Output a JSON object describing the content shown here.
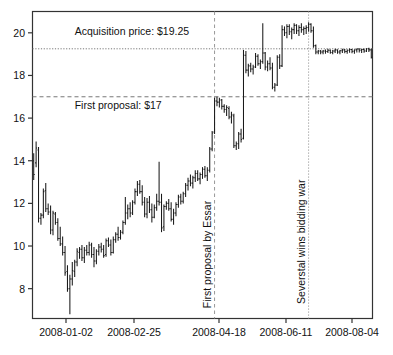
{
  "chart_data": {
    "type": "ohlc",
    "title": "",
    "xlabel": "",
    "ylabel": "",
    "ylim": [
      6.6,
      21.0
    ],
    "yticks": [
      8,
      10,
      12,
      14,
      16,
      18,
      20
    ],
    "ytick_labels": [
      "8",
      "10",
      "12",
      "14",
      "16",
      "18",
      "20"
    ],
    "xlim": [
      "2008-01-02",
      "2008-08-08"
    ],
    "xticks": [
      "2008-01-02",
      "2008-02-25",
      "2008-04-18",
      "2008-06-11",
      "2008-08-04"
    ],
    "xtick_labels": [
      "2008-01-02",
      "2008-02-25",
      "2008-04-18",
      "2008-06-11",
      "2008-08-04"
    ],
    "grid": false,
    "legend": "none",
    "series_name": "Esmark share price (USD)",
    "hlines": [
      {
        "name": "acquisition-price-line",
        "value": 19.25,
        "style": "dotted",
        "label": "Acquisition price: $19.25"
      },
      {
        "name": "first-proposal-line",
        "value": 17.0,
        "style": "dashed",
        "label": "First proposal: $17"
      }
    ],
    "vlines": [
      {
        "name": "first-proposal-event",
        "x_index": 75,
        "style": "dashed",
        "label": "First proposal by Essar"
      },
      {
        "name": "severstal-event",
        "x_index": 114,
        "style": "dotted",
        "label": "Severstal wins bidding war"
      }
    ],
    "annotations": [
      {
        "text": "Acquisition price: $19.25",
        "x_index": 17,
        "y": 19.9,
        "rotation": 0
      },
      {
        "text": "First proposal: $17",
        "x_index": 17,
        "y": 16.45,
        "rotation": 0
      },
      {
        "text": "First proposal by Essar",
        "x_index": 75,
        "y": 9.6,
        "rotation": 90
      },
      {
        "text": "Severstal wins bidding war",
        "x_index": 114,
        "y": 10.2,
        "rotation": 90
      }
    ],
    "bars": [
      {
        "h": 14.35,
        "l": 13.1,
        "o": 14.0,
        "c": 13.35
      },
      {
        "h": 14.9,
        "l": 13.7,
        "o": 13.9,
        "c": 14.6
      },
      {
        "h": 14.65,
        "l": 11.1,
        "o": 14.5,
        "c": 11.3
      },
      {
        "h": 11.55,
        "l": 11.0,
        "o": 11.3,
        "c": 11.45
      },
      {
        "h": 12.7,
        "l": 11.3,
        "o": 11.45,
        "c": 12.55
      },
      {
        "h": 12.95,
        "l": 11.6,
        "o": 12.6,
        "c": 11.75
      },
      {
        "h": 12.0,
        "l": 11.45,
        "o": 11.75,
        "c": 11.6
      },
      {
        "h": 11.9,
        "l": 10.55,
        "o": 11.6,
        "c": 10.75
      },
      {
        "h": 11.65,
        "l": 10.5,
        "o": 10.75,
        "c": 11.55
      },
      {
        "h": 11.6,
        "l": 11.0,
        "o": 11.5,
        "c": 11.1
      },
      {
        "h": 11.3,
        "l": 10.25,
        "o": 11.1,
        "c": 10.35
      },
      {
        "h": 10.9,
        "l": 10.0,
        "o": 10.35,
        "c": 10.1
      },
      {
        "h": 10.45,
        "l": 9.55,
        "o": 10.1,
        "c": 9.7
      },
      {
        "h": 10.0,
        "l": 8.6,
        "o": 9.7,
        "c": 8.75
      },
      {
        "h": 9.1,
        "l": 7.85,
        "o": 8.8,
        "c": 8.0
      },
      {
        "h": 8.65,
        "l": 6.8,
        "o": 8.0,
        "c": 8.45
      },
      {
        "h": 9.25,
        "l": 8.15,
        "o": 8.45,
        "c": 8.85
      },
      {
        "h": 9.35,
        "l": 8.55,
        "o": 8.8,
        "c": 9.25
      },
      {
        "h": 9.9,
        "l": 9.05,
        "o": 9.25,
        "c": 9.75
      },
      {
        "h": 9.95,
        "l": 9.4,
        "o": 9.7,
        "c": 9.85
      },
      {
        "h": 10.05,
        "l": 9.3,
        "o": 9.85,
        "c": 9.45
      },
      {
        "h": 9.95,
        "l": 9.2,
        "o": 9.45,
        "c": 9.8
      },
      {
        "h": 10.05,
        "l": 9.55,
        "o": 9.8,
        "c": 9.7
      },
      {
        "h": 10.2,
        "l": 9.55,
        "o": 9.7,
        "c": 10.05
      },
      {
        "h": 10.15,
        "l": 9.45,
        "o": 10.05,
        "c": 9.6
      },
      {
        "h": 9.95,
        "l": 9.0,
        "o": 9.6,
        "c": 9.3
      },
      {
        "h": 9.85,
        "l": 9.15,
        "o": 9.3,
        "c": 9.75
      },
      {
        "h": 10.1,
        "l": 9.55,
        "o": 9.75,
        "c": 9.95
      },
      {
        "h": 10.15,
        "l": 9.7,
        "o": 9.95,
        "c": 9.85
      },
      {
        "h": 10.05,
        "l": 9.45,
        "o": 9.85,
        "c": 9.55
      },
      {
        "h": 10.35,
        "l": 9.5,
        "o": 9.6,
        "c": 10.25
      },
      {
        "h": 10.4,
        "l": 9.95,
        "o": 10.25,
        "c": 10.05
      },
      {
        "h": 10.3,
        "l": 9.55,
        "o": 10.05,
        "c": 9.7
      },
      {
        "h": 10.45,
        "l": 9.65,
        "o": 9.7,
        "c": 10.3
      },
      {
        "h": 10.65,
        "l": 10.15,
        "o": 10.3,
        "c": 10.55
      },
      {
        "h": 10.9,
        "l": 10.25,
        "o": 10.55,
        "c": 10.4
      },
      {
        "h": 10.75,
        "l": 10.3,
        "o": 10.4,
        "c": 10.65
      },
      {
        "h": 11.2,
        "l": 10.55,
        "o": 10.65,
        "c": 11.1
      },
      {
        "h": 12.3,
        "l": 11.0,
        "o": 11.1,
        "c": 11.55
      },
      {
        "h": 11.95,
        "l": 11.25,
        "o": 11.55,
        "c": 11.75
      },
      {
        "h": 12.05,
        "l": 11.35,
        "o": 11.75,
        "c": 11.55
      },
      {
        "h": 12.15,
        "l": 11.45,
        "o": 11.55,
        "c": 12.05
      },
      {
        "h": 12.7,
        "l": 11.95,
        "o": 12.05,
        "c": 12.55
      },
      {
        "h": 13.05,
        "l": 12.35,
        "o": 12.55,
        "c": 12.9
      },
      {
        "h": 13.1,
        "l": 12.45,
        "o": 12.9,
        "c": 12.55
      },
      {
        "h": 12.85,
        "l": 11.9,
        "o": 12.55,
        "c": 12.05
      },
      {
        "h": 12.3,
        "l": 11.35,
        "o": 12.05,
        "c": 11.5
      },
      {
        "h": 12.25,
        "l": 11.3,
        "o": 11.5,
        "c": 12.05
      },
      {
        "h": 12.35,
        "l": 11.55,
        "o": 12.05,
        "c": 11.7
      },
      {
        "h": 12.0,
        "l": 11.1,
        "o": 11.7,
        "c": 11.35
      },
      {
        "h": 11.95,
        "l": 11.3,
        "o": 11.35,
        "c": 11.8
      },
      {
        "h": 12.45,
        "l": 11.65,
        "o": 11.8,
        "c": 12.1
      },
      {
        "h": 13.95,
        "l": 11.9,
        "o": 12.1,
        "c": 12.05
      },
      {
        "h": 12.45,
        "l": 10.65,
        "o": 12.05,
        "c": 10.85
      },
      {
        "h": 11.95,
        "l": 10.7,
        "o": 10.9,
        "c": 11.85
      },
      {
        "h": 12.1,
        "l": 11.7,
        "o": 11.85,
        "c": 12.0
      },
      {
        "h": 12.2,
        "l": 11.65,
        "o": 12.0,
        "c": 11.75
      },
      {
        "h": 12.05,
        "l": 11.15,
        "o": 11.75,
        "c": 11.25
      },
      {
        "h": 11.75,
        "l": 11.0,
        "o": 11.25,
        "c": 11.55
      },
      {
        "h": 12.05,
        "l": 11.4,
        "o": 11.55,
        "c": 11.95
      },
      {
        "h": 12.4,
        "l": 11.8,
        "o": 11.95,
        "c": 12.3
      },
      {
        "h": 12.45,
        "l": 11.95,
        "o": 12.3,
        "c": 12.1
      },
      {
        "h": 12.55,
        "l": 12.0,
        "o": 12.1,
        "c": 12.45
      },
      {
        "h": 12.95,
        "l": 12.3,
        "o": 12.45,
        "c": 12.85
      },
      {
        "h": 13.2,
        "l": 12.6,
        "o": 12.85,
        "c": 13.05
      },
      {
        "h": 13.35,
        "l": 12.8,
        "o": 13.05,
        "c": 12.95
      },
      {
        "h": 13.3,
        "l": 12.7,
        "o": 12.95,
        "c": 13.2
      },
      {
        "h": 13.55,
        "l": 13.0,
        "o": 13.2,
        "c": 13.4
      },
      {
        "h": 13.55,
        "l": 13.05,
        "o": 13.4,
        "c": 13.15
      },
      {
        "h": 13.45,
        "l": 12.9,
        "o": 13.15,
        "c": 13.35
      },
      {
        "h": 13.7,
        "l": 13.15,
        "o": 13.35,
        "c": 13.6
      },
      {
        "h": 13.75,
        "l": 13.2,
        "o": 13.6,
        "c": 13.3
      },
      {
        "h": 13.7,
        "l": 13.05,
        "o": 13.3,
        "c": 13.55
      },
      {
        "h": 14.65,
        "l": 13.45,
        "o": 13.55,
        "c": 14.55
      },
      {
        "h": 15.4,
        "l": 14.45,
        "o": 14.55,
        "c": 15.3
      },
      {
        "h": 16.95,
        "l": 15.25,
        "o": 15.35,
        "c": 16.8
      },
      {
        "h": 17.0,
        "l": 16.55,
        "o": 16.8,
        "c": 16.75
      },
      {
        "h": 16.95,
        "l": 16.5,
        "o": 16.75,
        "c": 16.85
      },
      {
        "h": 16.9,
        "l": 16.4,
        "o": 16.85,
        "c": 16.55
      },
      {
        "h": 16.65,
        "l": 16.25,
        "o": 16.55,
        "c": 16.4
      },
      {
        "h": 16.6,
        "l": 16.1,
        "o": 16.4,
        "c": 16.5
      },
      {
        "h": 16.55,
        "l": 15.95,
        "o": 16.45,
        "c": 16.05
      },
      {
        "h": 16.3,
        "l": 15.75,
        "o": 16.05,
        "c": 16.15
      },
      {
        "h": 16.2,
        "l": 14.6,
        "o": 16.1,
        "c": 14.7
      },
      {
        "h": 14.9,
        "l": 14.5,
        "o": 14.7,
        "c": 14.8
      },
      {
        "h": 15.35,
        "l": 14.55,
        "o": 14.8,
        "c": 15.25
      },
      {
        "h": 15.5,
        "l": 14.85,
        "o": 15.25,
        "c": 15.0
      },
      {
        "h": 19.2,
        "l": 15.0,
        "o": 15.05,
        "c": 18.95
      },
      {
        "h": 19.15,
        "l": 18.1,
        "o": 18.95,
        "c": 18.25
      },
      {
        "h": 18.55,
        "l": 17.95,
        "o": 18.25,
        "c": 18.45
      },
      {
        "h": 18.6,
        "l": 18.15,
        "o": 18.45,
        "c": 18.3
      },
      {
        "h": 18.5,
        "l": 18.05,
        "o": 18.3,
        "c": 18.4
      },
      {
        "h": 19.05,
        "l": 18.35,
        "o": 18.4,
        "c": 18.9
      },
      {
        "h": 19.0,
        "l": 18.45,
        "o": 18.9,
        "c": 18.55
      },
      {
        "h": 18.75,
        "l": 18.3,
        "o": 18.55,
        "c": 18.65
      },
      {
        "h": 20.45,
        "l": 18.55,
        "o": 18.65,
        "c": 19.05
      },
      {
        "h": 19.1,
        "l": 18.25,
        "o": 19.05,
        "c": 18.4
      },
      {
        "h": 18.7,
        "l": 18.2,
        "o": 18.4,
        "c": 18.55
      },
      {
        "h": 18.85,
        "l": 18.25,
        "o": 18.55,
        "c": 18.35
      },
      {
        "h": 18.6,
        "l": 17.35,
        "o": 18.35,
        "c": 17.45
      },
      {
        "h": 17.65,
        "l": 17.25,
        "o": 17.45,
        "c": 17.55
      },
      {
        "h": 18.95,
        "l": 17.5,
        "o": 17.55,
        "c": 18.85
      },
      {
        "h": 19.0,
        "l": 18.3,
        "o": 18.85,
        "c": 18.45
      },
      {
        "h": 20.35,
        "l": 18.4,
        "o": 18.45,
        "c": 20.15
      },
      {
        "h": 20.3,
        "l": 19.85,
        "o": 20.15,
        "c": 20.0
      },
      {
        "h": 20.4,
        "l": 19.75,
        "o": 20.0,
        "c": 20.3
      },
      {
        "h": 20.4,
        "l": 19.9,
        "o": 20.3,
        "c": 20.05
      },
      {
        "h": 20.25,
        "l": 19.7,
        "o": 20.05,
        "c": 20.15
      },
      {
        "h": 20.45,
        "l": 19.95,
        "o": 20.15,
        "c": 20.35
      },
      {
        "h": 20.4,
        "l": 19.95,
        "o": 20.35,
        "c": 20.1
      },
      {
        "h": 20.35,
        "l": 19.85,
        "o": 20.1,
        "c": 20.25
      },
      {
        "h": 20.45,
        "l": 20.0,
        "o": 20.25,
        "c": 20.15
      },
      {
        "h": 20.3,
        "l": 19.9,
        "o": 20.15,
        "c": 20.2
      },
      {
        "h": 20.35,
        "l": 19.95,
        "o": 20.2,
        "c": 20.25
      },
      {
        "h": 20.5,
        "l": 20.05,
        "o": 20.25,
        "c": 20.4
      },
      {
        "h": 20.45,
        "l": 20.0,
        "o": 20.4,
        "c": 20.1
      },
      {
        "h": 20.3,
        "l": 19.3,
        "o": 20.1,
        "c": 19.4
      },
      {
        "h": 19.45,
        "l": 19.0,
        "o": 19.4,
        "c": 19.1
      },
      {
        "h": 19.2,
        "l": 19.0,
        "o": 19.1,
        "c": 19.15
      },
      {
        "h": 19.2,
        "l": 19.0,
        "o": 19.15,
        "c": 19.1
      },
      {
        "h": 19.2,
        "l": 19.0,
        "o": 19.1,
        "c": 19.15
      },
      {
        "h": 19.22,
        "l": 19.02,
        "o": 19.15,
        "c": 19.12
      },
      {
        "h": 19.25,
        "l": 19.05,
        "o": 19.12,
        "c": 19.18
      },
      {
        "h": 19.22,
        "l": 19.02,
        "o": 19.18,
        "c": 19.08
      },
      {
        "h": 19.2,
        "l": 19.0,
        "o": 19.08,
        "c": 19.15
      },
      {
        "h": 19.25,
        "l": 19.05,
        "o": 19.15,
        "c": 19.2
      },
      {
        "h": 19.22,
        "l": 19.02,
        "o": 19.2,
        "c": 19.1
      },
      {
        "h": 19.2,
        "l": 19.0,
        "o": 19.1,
        "c": 19.16
      },
      {
        "h": 19.25,
        "l": 19.05,
        "o": 19.16,
        "c": 19.2
      },
      {
        "h": 19.24,
        "l": 19.04,
        "o": 19.2,
        "c": 19.12
      },
      {
        "h": 19.22,
        "l": 19.02,
        "o": 19.12,
        "c": 19.18
      },
      {
        "h": 19.26,
        "l": 19.06,
        "o": 19.18,
        "c": 19.22
      },
      {
        "h": 19.24,
        "l": 19.04,
        "o": 19.22,
        "c": 19.14
      },
      {
        "h": 19.22,
        "l": 19.02,
        "o": 19.14,
        "c": 19.2
      },
      {
        "h": 19.26,
        "l": 19.08,
        "o": 19.2,
        "c": 19.24
      },
      {
        "h": 19.28,
        "l": 19.08,
        "o": 19.24,
        "c": 19.18
      },
      {
        "h": 19.25,
        "l": 19.05,
        "o": 19.18,
        "c": 19.22
      },
      {
        "h": 19.26,
        "l": 19.06,
        "o": 19.22,
        "c": 19.15
      },
      {
        "h": 19.28,
        "l": 19.1,
        "o": 19.15,
        "c": 19.25
      },
      {
        "h": 19.3,
        "l": 19.1,
        "o": 19.25,
        "c": 19.2
      },
      {
        "h": 19.26,
        "l": 18.8,
        "o": 19.2,
        "c": 18.85
      }
    ]
  },
  "style": {
    "line_color": "#1a1a1a",
    "axis_color": "#333333",
    "text_color": "#111111",
    "background": "#ffffff",
    "hline_color": "#777777",
    "vline_color": "#999999"
  }
}
